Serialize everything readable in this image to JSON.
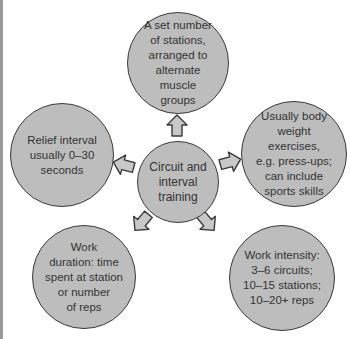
{
  "diagram": {
    "colors": {
      "node_fill": "#bdbdbd",
      "node_border": "#3a3a3a",
      "arrow_fill": "#c8c8c8",
      "arrow_stroke": "#3a3a3a",
      "text": "#333333"
    },
    "center": {
      "label": "Circuit and interval training",
      "lines": [
        "Circuit and",
        "interval",
        "training"
      ]
    },
    "nodes": [
      {
        "position": "top",
        "lines": [
          "A set number",
          "of stations,",
          "arranged to",
          "alternate muscle",
          "groups"
        ]
      },
      {
        "position": "left",
        "lines": [
          "Relief interval",
          "usually 0–30",
          "seconds"
        ]
      },
      {
        "position": "right",
        "lines": [
          "Usually body",
          "weight exercises,",
          "e.g. press-ups;",
          "can include",
          "sports skills"
        ]
      },
      {
        "position": "bottom-left",
        "lines": [
          "Work",
          "duration: time",
          "spent at station",
          "or number",
          "of reps"
        ]
      },
      {
        "position": "bottom-right",
        "lines": [
          "Work intensity:",
          "3–6 circuits;",
          "10–15 stations;",
          "10–20+ reps"
        ]
      }
    ],
    "arrows": [
      {
        "from": "center",
        "to": "top",
        "icon": "arrow-up-icon"
      },
      {
        "from": "center",
        "to": "left",
        "icon": "arrow-left-icon"
      },
      {
        "from": "center",
        "to": "right",
        "icon": "arrow-right-icon"
      },
      {
        "from": "center",
        "to": "bottom-left",
        "icon": "arrow-down-left-icon"
      },
      {
        "from": "center",
        "to": "bottom-right",
        "icon": "arrow-down-right-icon"
      }
    ]
  }
}
